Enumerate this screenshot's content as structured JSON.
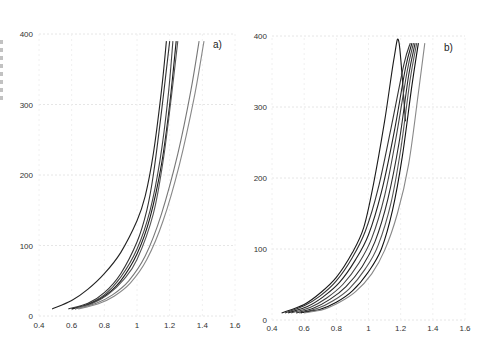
{
  "chart_data": [
    {
      "type": "line",
      "panel_label": "a)",
      "title": "",
      "xlabel": "",
      "ylabel": "",
      "xlim": [
        0.4,
        1.6
      ],
      "ylim": [
        0,
        400
      ],
      "x_ticks": [
        "0.4",
        "0.6",
        "0.8",
        "1",
        "1.2",
        "1.4",
        "1.6"
      ],
      "y_ticks": [
        "0",
        "100",
        "200",
        "300",
        "400"
      ],
      "grid": true,
      "legend": null,
      "series": [
        {
          "name": "curve1",
          "color": "#222222",
          "x": [
            0.48,
            0.6,
            0.7,
            0.8,
            0.9,
            1.0,
            1.05,
            1.1,
            1.15,
            1.18
          ],
          "y": [
            10,
            22,
            38,
            60,
            90,
            135,
            170,
            230,
            320,
            390
          ]
        },
        {
          "name": "curve2",
          "color": "#333333",
          "x": [
            0.58,
            0.7,
            0.8,
            0.9,
            1.0,
            1.06,
            1.1,
            1.15,
            1.2
          ],
          "y": [
            10,
            18,
            33,
            60,
            105,
            150,
            200,
            290,
            390
          ]
        },
        {
          "name": "curve3",
          "color": "#444444",
          "x": [
            0.6,
            0.7,
            0.8,
            0.9,
            1.0,
            1.08,
            1.14,
            1.19,
            1.22
          ],
          "y": [
            10,
            17,
            30,
            55,
            95,
            150,
            220,
            310,
            390
          ]
        },
        {
          "name": "curve4",
          "color": "#1a1a1a",
          "x": [
            0.6,
            0.7,
            0.8,
            0.9,
            1.0,
            1.08,
            1.15,
            1.2,
            1.24
          ],
          "y": [
            10,
            16,
            28,
            50,
            88,
            140,
            215,
            300,
            390
          ]
        },
        {
          "name": "curve5",
          "color": "#555555",
          "x": [
            0.62,
            0.72,
            0.82,
            0.92,
            1.0,
            1.1,
            1.16,
            1.21,
            1.25
          ],
          "y": [
            10,
            17,
            30,
            52,
            80,
            145,
            220,
            310,
            390
          ]
        },
        {
          "name": "curve6",
          "color": "#777777",
          "x": [
            0.62,
            0.75,
            0.85,
            0.95,
            1.05,
            1.15,
            1.25,
            1.33,
            1.38
          ],
          "y": [
            10,
            18,
            30,
            50,
            85,
            145,
            230,
            320,
            390
          ]
        },
        {
          "name": "curve7",
          "color": "#888888",
          "x": [
            0.64,
            0.76,
            0.86,
            0.96,
            1.06,
            1.16,
            1.26,
            1.35,
            1.41
          ],
          "y": [
            10,
            17,
            28,
            47,
            80,
            135,
            215,
            310,
            390
          ]
        }
      ]
    },
    {
      "type": "line",
      "panel_label": "b)",
      "title": "",
      "xlabel": "",
      "ylabel": "",
      "xlim": [
        0.4,
        1.6
      ],
      "ylim": [
        0,
        400
      ],
      "x_ticks": [
        "0.4",
        "0.6",
        "0.8",
        "1",
        "1.2",
        "1.4",
        "1.6"
      ],
      "y_ticks": [
        "0",
        "100",
        "200",
        "300",
        "400"
      ],
      "grid": true,
      "legend": null,
      "series": [
        {
          "name": "curve1",
          "color": "#1a1a1a",
          "x": [
            0.46,
            0.6,
            0.7,
            0.8,
            0.9,
            0.97,
            1.03,
            1.1,
            1.16,
            1.19,
            1.23
          ],
          "y": [
            10,
            22,
            38,
            60,
            95,
            130,
            190,
            280,
            370,
            390,
            280
          ]
        },
        {
          "name": "curve2",
          "color": "#333333",
          "x": [
            0.48,
            0.6,
            0.7,
            0.8,
            0.9,
            0.98,
            1.06,
            1.14,
            1.22,
            1.26
          ],
          "y": [
            10,
            20,
            34,
            55,
            88,
            125,
            185,
            270,
            360,
            390
          ]
        },
        {
          "name": "curve3",
          "color": "#222222",
          "x": [
            0.5,
            0.62,
            0.72,
            0.82,
            0.92,
            1.0,
            1.08,
            1.16,
            1.23,
            1.27
          ],
          "y": [
            10,
            19,
            33,
            53,
            85,
            120,
            180,
            265,
            355,
            390
          ]
        },
        {
          "name": "curve4",
          "color": "#444444",
          "x": [
            0.52,
            0.64,
            0.74,
            0.84,
            0.94,
            1.02,
            1.1,
            1.17,
            1.24,
            1.28
          ],
          "y": [
            10,
            18,
            31,
            50,
            80,
            115,
            175,
            255,
            350,
            390
          ]
        },
        {
          "name": "curve5",
          "color": "#2a2a2a",
          "x": [
            0.55,
            0.66,
            0.76,
            0.86,
            0.96,
            1.04,
            1.12,
            1.19,
            1.25,
            1.29
          ],
          "y": [
            10,
            17,
            29,
            47,
            75,
            110,
            170,
            250,
            345,
            390
          ]
        },
        {
          "name": "curve6",
          "color": "#555555",
          "x": [
            0.57,
            0.68,
            0.78,
            0.88,
            0.98,
            1.06,
            1.14,
            1.2,
            1.26,
            1.3
          ],
          "y": [
            10,
            16,
            27,
            44,
            72,
            105,
            165,
            240,
            340,
            390
          ]
        },
        {
          "name": "curve7",
          "color": "#111111",
          "x": [
            0.58,
            0.7,
            0.8,
            0.9,
            1.0,
            1.08,
            1.15,
            1.21,
            1.27,
            1.31
          ],
          "y": [
            10,
            15,
            25,
            41,
            68,
            100,
            155,
            230,
            330,
            390
          ]
        },
        {
          "name": "curve8",
          "color": "#888888",
          "x": [
            0.6,
            0.72,
            0.82,
            0.92,
            1.02,
            1.1,
            1.18,
            1.25,
            1.31,
            1.35
          ],
          "y": [
            10,
            15,
            25,
            40,
            65,
            98,
            150,
            220,
            320,
            390
          ]
        }
      ]
    }
  ]
}
